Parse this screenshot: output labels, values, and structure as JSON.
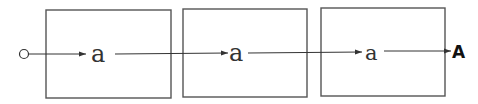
{
  "diagram": {
    "type": "finite-state chain",
    "start_marker": "circle",
    "boxes": [
      {
        "id": "box-1",
        "label": "a"
      },
      {
        "id": "box-2",
        "label": "a"
      },
      {
        "id": "box-3",
        "label": "a"
      }
    ],
    "final_label": "A",
    "colors": {
      "stroke": "#555555",
      "text": "#333333",
      "background": "#ffffff"
    }
  }
}
